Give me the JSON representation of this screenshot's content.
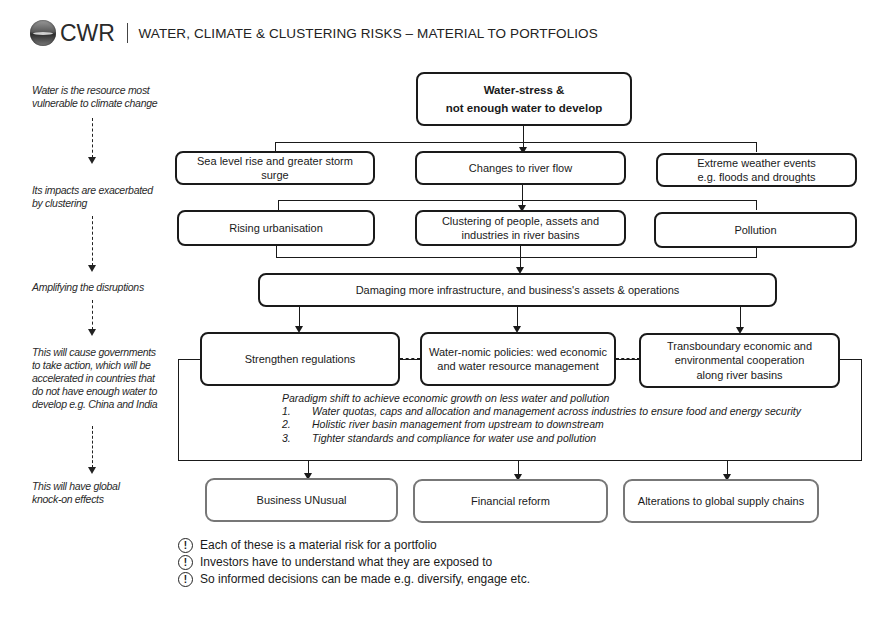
{
  "header": {
    "logo_icon": "globe-water-icon",
    "brand": "CWR",
    "separator": "|",
    "title": "WATER, CLIMATE & CLUSTERING RISKS – MATERIAL TO PORTFOLIOS"
  },
  "side_notes": [
    "Water is the resource most vulnerable to climate change",
    "Its impacts are exacerbated by clustering",
    "Amplifying the disruptions",
    "This will cause governments to take action, which will be accelerated in countries that do not have enough water to develop e.g. China and India",
    "This will have global knock-on effects"
  ],
  "side_notes_lines": {
    "n0": [
      "Water is the resource most",
      "vulnerable to climate change"
    ],
    "n1": [
      "Its impacts are exacerbated",
      "by clustering"
    ],
    "n2": [
      "Amplifying the disruptions"
    ],
    "n3": [
      "This will cause governments",
      "to take action, which will be",
      "accelerated in countries that",
      "do not have enough water to",
      "develop e.g. China and India"
    ],
    "n4": [
      "This will have global",
      "knock-on effects"
    ]
  },
  "diagram": {
    "root": {
      "line1": "Water-stress  &",
      "line2": "not enough water to develop"
    },
    "impacts": [
      {
        "line1": "Sea level rise and greater storm",
        "line2": "surge"
      },
      {
        "line1": "Changes to river flow",
        "line2": ""
      },
      {
        "line1": "Extreme weather events",
        "line2": "e.g. floods and droughts"
      }
    ],
    "clustering": [
      {
        "line1": "Rising urbanisation",
        "line2": ""
      },
      {
        "line1": "Clustering of people, assets and",
        "line2": "industries in river basins"
      },
      {
        "line1": "Pollution",
        "line2": ""
      }
    ],
    "damage": "Damaging more infrastructure, and business's assets & operations",
    "actions": [
      {
        "line1": "Strengthen regulations",
        "line2": "",
        "line3": ""
      },
      {
        "line1": "Water-nomic policies: wed economic",
        "line2": "and water resource management",
        "line3": ""
      },
      {
        "line1": "Transboundary economic and",
        "line2": "environmental cooperation",
        "line3": "along river basins"
      }
    ],
    "policy": {
      "heading": "Paradigm shift to achieve economic growth on less water and pollution",
      "items": [
        {
          "num": "1.",
          "text": "Water quotas, caps and allocation and management across industries to ensure food and energy security"
        },
        {
          "num": "2.",
          "text": "Holistic river basin management from upstream to downstream"
        },
        {
          "num": "3.",
          "text": "Tighter standards and compliance for water use and pollution"
        }
      ]
    },
    "effects": [
      "Business UNusual",
      "Financial reform",
      "Alterations to global supply chains"
    ]
  },
  "takeaways": {
    "icon": "exclamation-circle-icon",
    "icon_glyph": "!",
    "items": [
      "Each of these is a material risk for a portfolio",
      "Investors have to understand what they are exposed to",
      "So informed decisions can be made e.g. diversify, engage etc."
    ]
  }
}
